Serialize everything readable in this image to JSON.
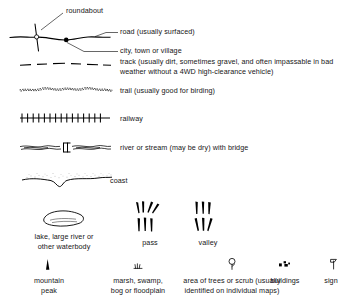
{
  "figure": {
    "kind": "map-legend",
    "ink_color": "#000000",
    "background": "#ffffff",
    "text_color": "#161616"
  },
  "callouts": {
    "roundabout": "roundabout",
    "road": "road (usually surfaced)",
    "city": "city, town or village"
  },
  "line_entries": [
    {
      "key": "track",
      "symbol": "dashed-line",
      "label_line1": "track (usually dirt, sometimes gravel, and often impassable in bad",
      "label_line2": "weather without a 4WD high-clearance vehicle)"
    },
    {
      "key": "trail",
      "symbol": "dotted-wavy-line",
      "label_line1": "trail (usually good for birding)",
      "label_line2": ""
    },
    {
      "key": "railway",
      "symbol": "hatched-line",
      "label_line1": "railway",
      "label_line2": ""
    },
    {
      "key": "river",
      "symbol": "wavy-double-line-with-bridge",
      "label_line1": "river or stream (may be dry) with bridge",
      "label_line2": ""
    },
    {
      "key": "coast",
      "symbol": "stippled-coastline",
      "label_line1": "coast",
      "label_line2": ""
    }
  ],
  "area_entries": [
    {
      "key": "lake",
      "symbol": "waterbody-polygon",
      "label_line1": "lake, large river or",
      "label_line2": "other waterbody"
    },
    {
      "key": "pass",
      "symbol": "pass-chevrons",
      "label_line1": "pass",
      "label_line2": ""
    },
    {
      "key": "valley",
      "symbol": "valley-chevrons",
      "label_line1": "valley",
      "label_line2": ""
    }
  ],
  "point_entries": [
    {
      "key": "mountain-peak",
      "symbol": "peak-triangle",
      "label_line1": "mountain",
      "label_line2": "peak"
    },
    {
      "key": "marsh",
      "symbol": "marsh-tuft",
      "label_line1": "marsh, swamp,",
      "label_line2": "bog or floodplain"
    },
    {
      "key": "trees",
      "symbol": "tree-glyph",
      "label_line1": "area of trees or scrub (usually",
      "label_line2": "identified on individual maps)"
    },
    {
      "key": "buildings",
      "symbol": "buildings-blocks",
      "label_line1": "buildings",
      "label_line2": ""
    },
    {
      "key": "sign",
      "symbol": "signpost",
      "label_line1": "sign",
      "label_line2": ""
    }
  ]
}
